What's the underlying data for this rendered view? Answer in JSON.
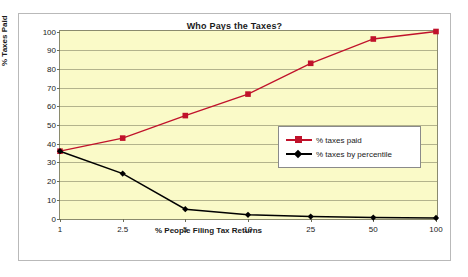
{
  "chart_data": {
    "type": "line",
    "title": "Who Pays the Taxes?",
    "xlabel": "% People Filing Tax Returns",
    "ylabel": "% Taxes Paid",
    "categories": [
      "1",
      "2.5",
      "5",
      "10",
      "25",
      "50",
      "100"
    ],
    "ylim": [
      0,
      100
    ],
    "yticks": [
      "0",
      "10",
      "20",
      "30",
      "40",
      "50",
      "60",
      "70",
      "80",
      "90",
      "100"
    ],
    "grid": true,
    "legend_position": "center-right",
    "plot_background": "#fafac8",
    "series": [
      {
        "name": "% taxes paid",
        "color": "#c0122b",
        "marker": "square",
        "values": [
          36,
          43,
          55,
          66.5,
          83,
          96,
          100
        ]
      },
      {
        "name": "% taxes by percentile",
        "color": "#000000",
        "marker": "diamond",
        "values": [
          36,
          24,
          5,
          2,
          1,
          0.5,
          0.3
        ]
      }
    ]
  }
}
